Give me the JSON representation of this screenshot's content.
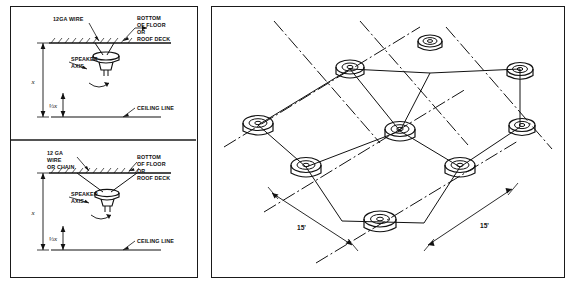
{
  "figure": {
    "panels": [
      {
        "id": "left-panel",
        "name": "mounting-detail-panel",
        "subpanels": [
          {
            "id": "upper-detail",
            "name": "wire-suspension-detail",
            "labels": {
              "wire": "12GA  WIRE",
              "deck": "BOTTOM\nOF FLOOR\nOR\nROOF DECK",
              "deck_line1": "BOTTOM",
              "deck_line2": "OF FLOOR",
              "deck_line3": "OR",
              "deck_line4": "ROOF DECK",
              "axis_line1": "SPEAKER",
              "axis_line2": "AXIS",
              "ceiling": "CEILING LINE",
              "dim_full": "x",
              "dim_frac": "⅓x"
            }
          },
          {
            "id": "lower-detail",
            "name": "wire-or-chain-suspension-detail",
            "labels": {
              "wire_line1": "12 GA",
              "wire_line2": "WIRE",
              "wire_line3": "OR CHAIN",
              "deck_line1": "BOTTOM",
              "deck_line2": "OF FLOOR",
              "deck_line3": "OR",
              "deck_line4": "ROOF DECK",
              "axis_line1": "SPEAKER",
              "axis_line2": "AXIS",
              "ceiling": "CEILING LINE",
              "dim_full": "x",
              "dim_frac": "⅓x"
            }
          }
        ]
      },
      {
        "id": "right-panel",
        "name": "speaker-grid-layout-panel",
        "labels": {
          "spacing_left": "15'",
          "spacing_right": "15'"
        },
        "grid": {
          "rows": 3,
          "cols": 3,
          "speaker_count": 9
        }
      }
    ]
  },
  "colors": {
    "ink": "#111111",
    "border": "#1a1a1a",
    "paper": "#ffffff"
  }
}
